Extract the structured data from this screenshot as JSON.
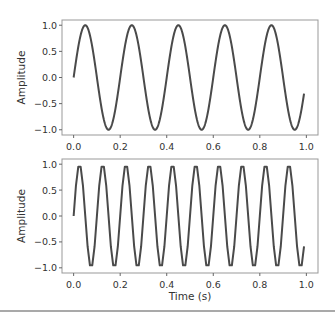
{
  "chart_data": [
    {
      "type": "line",
      "title": "",
      "xlabel": "",
      "ylabel": "Amplitude",
      "xlim": [
        -0.05,
        1.05
      ],
      "ylim": [
        -1.1,
        1.1
      ],
      "xticks": [
        0.0,
        0.2,
        0.4,
        0.6,
        0.8,
        1.0
      ],
      "xtick_labels": [
        "0.0",
        "0.2",
        "0.4",
        "0.6",
        "0.8",
        "1.0"
      ],
      "yticks": [
        1.0,
        0.5,
        0.0,
        -0.5,
        -1.0
      ],
      "ytick_labels": [
        "1.0",
        "0.5",
        "0.0",
        "−0.5",
        "−1.0"
      ],
      "grid": false,
      "series": [
        {
          "name": "sine 5 Hz",
          "function": "sin(2*pi*f*t)",
          "frequency_hz": 5,
          "amplitude": 1.0,
          "t_start": 0.0,
          "t_end": 0.99,
          "color": "#4a4a4a"
        }
      ]
    },
    {
      "type": "line",
      "title": "",
      "xlabel": "Time (s)",
      "ylabel": "Amplitude",
      "xlim": [
        -0.05,
        1.05
      ],
      "ylim": [
        -1.1,
        1.1
      ],
      "xticks": [
        0.0,
        0.2,
        0.4,
        0.6,
        0.8,
        1.0
      ],
      "xtick_labels": [
        "0.0",
        "0.2",
        "0.4",
        "0.6",
        "0.8",
        "1.0"
      ],
      "yticks": [
        1.0,
        0.5,
        0.0,
        -0.5,
        -1.0
      ],
      "ytick_labels": [
        "1.0",
        "0.5",
        "0.0",
        "−0.5",
        "−1.0"
      ],
      "grid": false,
      "series": [
        {
          "name": "sine 10 Hz",
          "function": "sin(2*pi*f*t)",
          "frequency_hz": 10,
          "amplitude": 1.0,
          "t_start": 0.0,
          "t_end": 0.99,
          "sample_step": 0.01,
          "color": "#4a4a4a"
        }
      ]
    }
  ]
}
